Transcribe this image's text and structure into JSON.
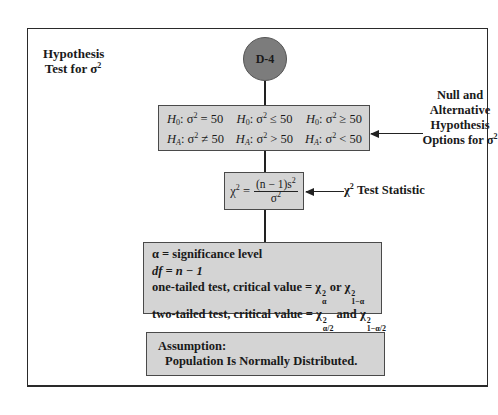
{
  "title": {
    "line1": "Hypothesis",
    "line2": "Test for σ",
    "sup": "2"
  },
  "node": {
    "label": "D-4",
    "color": "#7c7c7c"
  },
  "hypotheses": {
    "null_options": [
      {
        "H": "H",
        "sub": "0",
        "rel": ": σ",
        "sup": "2",
        "val": " = 50"
      },
      {
        "H": "H",
        "sub": "0",
        "rel": ": σ",
        "sup": "2",
        "val": " ≤ 50"
      },
      {
        "H": "H",
        "sub": "0",
        "rel": ": σ",
        "sup": "2",
        "val": " ≥ 50"
      }
    ],
    "alt_options": [
      {
        "H": "H",
        "sub": "A",
        "rel": ": σ",
        "sup": "2",
        "val": " ≠ 50"
      },
      {
        "H": "H",
        "sub": "A",
        "rel": ": σ",
        "sup": "2",
        "val": " > 50"
      },
      {
        "H": "H",
        "sub": "A",
        "rel": ": σ",
        "sup": "2",
        "val": " < 50"
      }
    ],
    "side_label": {
      "lines": [
        "Null and",
        "Alternative",
        "Hypothesis",
        "Options for σ"
      ],
      "sup": "2"
    }
  },
  "test_statistic": {
    "lhs": "χ",
    "lhs_sup": "2",
    "eq": " =",
    "numerator": "(n − 1)s",
    "numerator_sup": "2",
    "denominator": "σ",
    "denominator_sup": "2",
    "side_label": "χ",
    "side_label_sup": "2",
    "side_label_rest": " Test Statistic"
  },
  "criteria": {
    "alpha_line": "α = significance level",
    "df_line": "df = n − 1",
    "one_tailed": {
      "text": "one-tailed test, critical value = χ",
      "sub1": "α",
      "sup1": "2",
      "mid": " or χ",
      "sub2": "1−α",
      "sup2": "2"
    },
    "two_tailed": {
      "text": "two-tailed test, critical value = χ",
      "sub1": "α/2",
      "sup1": "2",
      "mid": " and χ",
      "sub2": "1−α/2",
      "sup2": "2"
    }
  },
  "assumption": {
    "heading": "Assumption:",
    "text": "Population Is Normally Distributed."
  },
  "colors": {
    "box_fill": "#d4d4d4",
    "node_fill": "#7c7c7c",
    "line": "#222222"
  }
}
